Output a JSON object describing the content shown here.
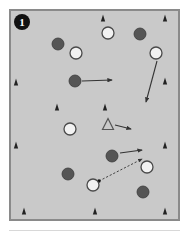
{
  "figure": {
    "panel_label": "1",
    "panel_label_style": "filled-circle-numeral",
    "background_color": "#c9c9c9",
    "border_color": "#8a8a8a",
    "page_background": "#ffffff",
    "width": 189,
    "height": 238
  },
  "legend_semantics": {
    "filled_circle": "dark-filled-circle-marker",
    "open_circle": "open-white-circle-marker",
    "open_triangle": "open-triangle-marker",
    "solid_triangle": "solid-triangle-marker",
    "solid_arrow": "solid-vector-arrow",
    "dashed_arrow": "dashed-vector-arrow"
  },
  "colors": {
    "filled_circle_fill": "#555555",
    "filled_circle_stroke": "#3a3a3a",
    "open_circle_fill": "#f2f2f2",
    "open_circle_stroke": "#4a4a4a",
    "triangle_fill": "#222222",
    "open_triangle_stroke": "#555555",
    "arrow_stroke": "#333333",
    "dashed_arrow_stroke": "#333333"
  },
  "chart_data": {
    "type": "scatter",
    "title": "",
    "xlabel": "",
    "ylabel": "",
    "xlim": [
      9,
      180
    ],
    "ylim": [
      9,
      221
    ],
    "grid": false,
    "legend": "none",
    "series": [
      {
        "name": "filled-circles",
        "marker": "filled_circle",
        "radius": 6,
        "points": [
          {
            "x": 58,
            "y": 44
          },
          {
            "x": 140,
            "y": 34
          },
          {
            "x": 75,
            "y": 81
          },
          {
            "x": 112,
            "y": 156
          },
          {
            "x": 68,
            "y": 174
          },
          {
            "x": 143,
            "y": 192
          }
        ]
      },
      {
        "name": "open-circles",
        "marker": "open_circle",
        "radius": 6,
        "points": [
          {
            "x": 108,
            "y": 33
          },
          {
            "x": 76,
            "y": 53
          },
          {
            "x": 156,
            "y": 53
          },
          {
            "x": 70,
            "y": 129
          },
          {
            "x": 147,
            "y": 167
          },
          {
            "x": 93,
            "y": 185
          }
        ]
      },
      {
        "name": "open-triangles",
        "marker": "open_triangle",
        "size": 11,
        "points": [
          {
            "x": 108,
            "y": 124
          }
        ]
      },
      {
        "name": "solid-triangles",
        "marker": "solid_triangle",
        "size": 7,
        "points": [
          {
            "x": 103,
            "y": 18
          },
          {
            "x": 165,
            "y": 18
          },
          {
            "x": 16,
            "y": 82
          },
          {
            "x": 165,
            "y": 81
          },
          {
            "x": 57,
            "y": 107
          },
          {
            "x": 105,
            "y": 107
          },
          {
            "x": 16,
            "y": 145
          },
          {
            "x": 165,
            "y": 145
          },
          {
            "x": 24,
            "y": 211
          },
          {
            "x": 95,
            "y": 211
          },
          {
            "x": 165,
            "y": 211
          }
        ]
      }
    ],
    "vectors": [
      {
        "name": "vector-1",
        "style": "solid",
        "x1": 82,
        "y1": 81,
        "x2": 112,
        "y2": 80,
        "arrowhead": "end"
      },
      {
        "name": "vector-2",
        "style": "solid",
        "x1": 157,
        "y1": 61,
        "x2": 146,
        "y2": 102,
        "arrowhead": "end"
      },
      {
        "name": "vector-3",
        "style": "solid",
        "x1": 115,
        "y1": 125,
        "x2": 131,
        "y2": 129,
        "arrowhead": "end"
      },
      {
        "name": "vector-4",
        "style": "solid",
        "x1": 120,
        "y1": 153,
        "x2": 142,
        "y2": 150,
        "arrowhead": "end"
      },
      {
        "name": "vector-5",
        "style": "dashed",
        "x1": 99,
        "y1": 181,
        "x2": 142,
        "y2": 159,
        "arrowhead": "end",
        "origin_dot": true
      }
    ]
  }
}
